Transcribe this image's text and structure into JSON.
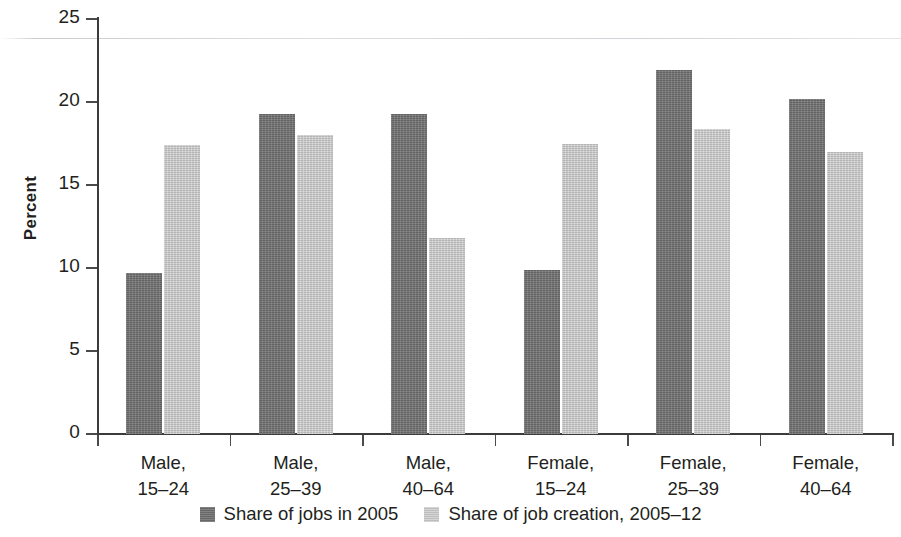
{
  "chart_data": {
    "type": "bar",
    "title": "",
    "subtitle": "",
    "xlabel": "",
    "ylabel": "Percent",
    "ylim": [
      0,
      25
    ],
    "yticks": [
      0,
      5,
      10,
      15,
      20,
      25
    ],
    "ytick_labels": [
      "0",
      "5",
      "10",
      "15",
      "20",
      "25"
    ],
    "grid": false,
    "legend_position": "bottom",
    "categories": [
      "Male, 15–24",
      "Male, 25–39",
      "Male, 40–64",
      "Female, 15–24",
      "Female, 25–39",
      "Female, 40–64"
    ],
    "category_lines": [
      [
        "Male,",
        "15–24"
      ],
      [
        "Male,",
        "25–39"
      ],
      [
        "Male,",
        "40–64"
      ],
      [
        "Female,",
        "15–24"
      ],
      [
        "Female,",
        "25–39"
      ],
      [
        "Female,",
        "40–64"
      ]
    ],
    "series": [
      {
        "name": "Share of jobs in 2005",
        "color": "#707070",
        "values": [
          9.7,
          19.3,
          19.3,
          9.9,
          21.9,
          20.2
        ]
      },
      {
        "name": "Share of job creation, 2005–12",
        "color": "#c9c9c9",
        "values": [
          17.4,
          18.0,
          11.8,
          17.5,
          18.4,
          17.0
        ]
      }
    ]
  },
  "legend": {
    "items": [
      {
        "label": "Share of jobs in 2005",
        "swatch": "dark-gray-swatch"
      },
      {
        "label": "Share of job creation, 2005–12",
        "swatch": "light-gray-swatch"
      }
    ]
  }
}
